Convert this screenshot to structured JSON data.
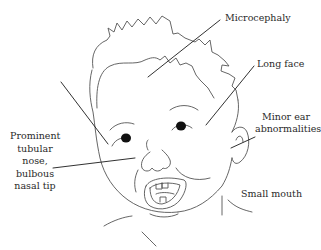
{
  "figure": {
    "type": "annotated-illustration",
    "line_color": "#555555",
    "leader_color": "#1a1a1a",
    "text_color": "#2a2a2a"
  },
  "labels": {
    "microcephaly": "Microcephaly",
    "long_face": "Long face",
    "ear_line1": "Minor ear",
    "ear_line2": "abnormalities",
    "nose_line1": "Prominent",
    "nose_line2": "tubular",
    "nose_line3": "nose,",
    "nose_line4": "bulbous",
    "nose_line5": "nasal tip",
    "small_mouth": "Small mouth"
  }
}
